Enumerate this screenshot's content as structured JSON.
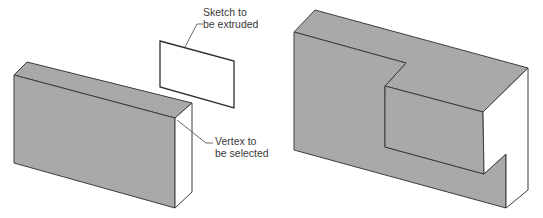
{
  "colors": {
    "face_gray": "#a9a9a9",
    "face_white": "#ffffff",
    "edge": "#3c3c3c",
    "leader": "#5a5a5a",
    "text": "#3a3a3a"
  },
  "labels": {
    "sketch": {
      "line1": "Sketch to",
      "line2": "be extruded"
    },
    "vertex": {
      "line1": "Vertex to",
      "line2": "be selected"
    }
  },
  "figures": [
    {
      "id": "before",
      "description": "Block with a separate rectangular sketch above it"
    },
    {
      "id": "after",
      "description": "Block with sketch extruded as a step/notch feature"
    }
  ]
}
